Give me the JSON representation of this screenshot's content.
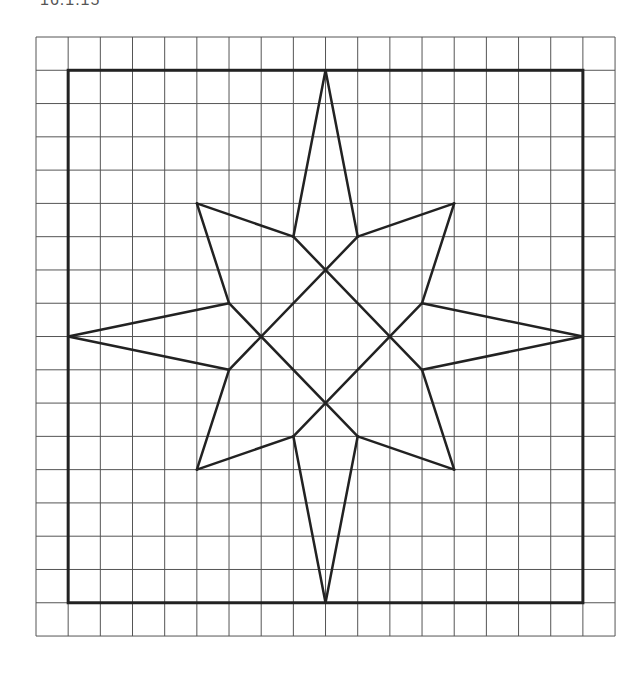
{
  "caption": "16.1.15",
  "grid": {
    "origin": [
      36,
      37
    ],
    "cell_w": 32.17,
    "cell_h": 33.28,
    "cols": 18,
    "rows": 18,
    "line_color": "#555555",
    "stroke_color": "#222222"
  },
  "frame": {
    "from": [
      1,
      1
    ],
    "to": [
      17,
      17
    ]
  },
  "points": {
    "N": [
      9,
      1
    ],
    "S": [
      9,
      17
    ],
    "W": [
      1,
      9
    ],
    "E": [
      17,
      9
    ],
    "NW": [
      5,
      5
    ],
    "NE": [
      13,
      5
    ],
    "SW": [
      5,
      13
    ],
    "SE": [
      13,
      13
    ],
    "a": [
      8,
      6
    ],
    "b": [
      10,
      6
    ],
    "c": [
      12,
      8
    ],
    "d": [
      12,
      10
    ],
    "e": [
      10,
      12
    ],
    "f": [
      8,
      12
    ],
    "g": [
      6,
      10
    ],
    "h": [
      6,
      8
    ]
  },
  "segments": [
    [
      "N",
      "a"
    ],
    [
      "N",
      "b"
    ],
    [
      "NE",
      "b"
    ],
    [
      "NE",
      "c"
    ],
    [
      "E",
      "c"
    ],
    [
      "E",
      "d"
    ],
    [
      "SE",
      "d"
    ],
    [
      "SE",
      "e"
    ],
    [
      "S",
      "e"
    ],
    [
      "S",
      "f"
    ],
    [
      "SW",
      "f"
    ],
    [
      "SW",
      "g"
    ],
    [
      "W",
      "g"
    ],
    [
      "W",
      "h"
    ],
    [
      "NW",
      "h"
    ],
    [
      "NW",
      "a"
    ],
    [
      "a",
      "d"
    ],
    [
      "b",
      "g"
    ],
    [
      "h",
      "e"
    ],
    [
      "c",
      "f"
    ]
  ]
}
